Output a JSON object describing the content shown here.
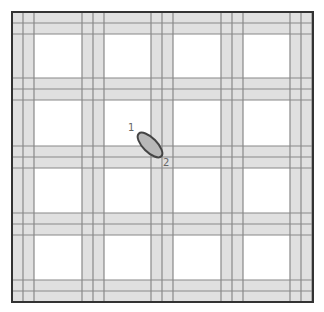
{
  "diagram": {
    "type": "grid-road-map",
    "outer_border": {
      "x": 12,
      "y": 12,
      "width": 301,
      "height": 290
    },
    "road_band_width": 22,
    "vertical_roads_x": [
      12,
      82,
      151,
      221,
      290
    ],
    "horizontal_roads_y": [
      12,
      78,
      146,
      213,
      280
    ],
    "colors": {
      "road_fill": "#e0e0e0",
      "road_line": "#888888",
      "block_fill": "#ffffff",
      "border": "#333333",
      "object_fill": "#b8b8b8",
      "object_stroke": "#444444"
    }
  },
  "object": {
    "name": "ellipse-object",
    "cx": 150,
    "cy": 145,
    "rx": 16,
    "ry": 7,
    "rotate": 45
  },
  "labels": [
    {
      "id": "label-1",
      "text": "1",
      "x": 128,
      "y": 131
    },
    {
      "id": "label-2",
      "text": "2",
      "x": 163,
      "y": 166
    }
  ]
}
